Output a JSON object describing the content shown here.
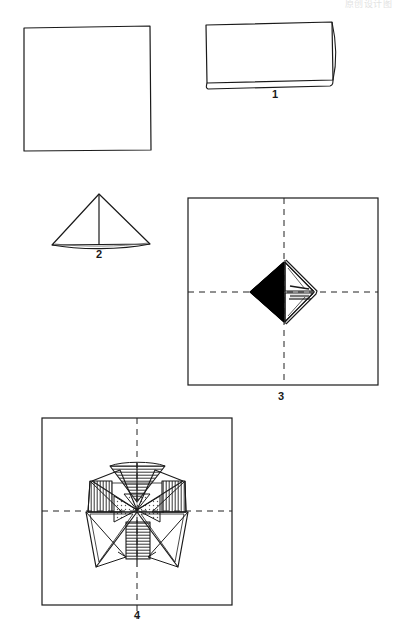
{
  "page": {
    "background_color": "#ffffff",
    "ink_color": "#1a1a1a",
    "width": 396,
    "height": 619
  },
  "watermark": {
    "text": "原创设计图"
  },
  "steps": [
    {
      "id": "step-0",
      "label": "",
      "name": "plain-square",
      "description": "Unfolded square sheet of paper",
      "shape": "square"
    },
    {
      "id": "step-1",
      "label": "1",
      "name": "folded-rectangle",
      "description": "Square folded in half to form a rectangle with a visible fold edge",
      "shape": "rectangle"
    },
    {
      "id": "step-2",
      "label": "2",
      "name": "folded-triangle",
      "description": "Rectangle folded into a triangle with a vertical center crease",
      "shape": "triangle"
    },
    {
      "id": "step-3",
      "label": "3",
      "name": "diamond-on-square",
      "description": "Square sheet with dashed center crosshair lines and a small half-black diamond module at the center",
      "shape": "square-with-diamond"
    },
    {
      "id": "step-4",
      "label": "4",
      "name": "pinwheel-assembly",
      "description": "Square sheet with dashed center crosshair lines and an assembled hatched pinwheel star at the center",
      "shape": "square-with-pinwheel"
    }
  ],
  "colors": {
    "ink": "#1a1a1a",
    "fill_black": "#000000",
    "paper": "#ffffff",
    "dash": "#222222",
    "hatch": "#333333"
  }
}
